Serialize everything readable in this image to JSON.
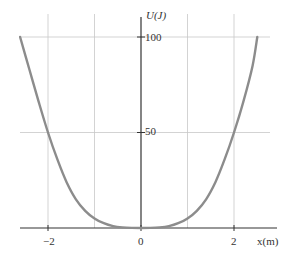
{
  "chart_data": {
    "type": "line",
    "title": "",
    "xlabel": "x(m)",
    "ylabel": "U(J)",
    "xlim": [
      -2.6,
      2.5
    ],
    "ylim": [
      0,
      100
    ],
    "x_ticks": [
      -2,
      0,
      2
    ],
    "x_tick_labels": [
      "-2",
      "0",
      "2"
    ],
    "y_ticks": [
      50,
      100
    ],
    "y_tick_labels": [
      "50",
      "100"
    ],
    "grid": true,
    "grid_x": [
      -2,
      -1,
      1,
      2
    ],
    "grid_y": [
      50,
      100
    ],
    "legend": null,
    "series": [
      {
        "name": "U(x)",
        "color": "#8c8c8c",
        "x": [
          -2.6,
          -2.4,
          -2.2,
          -2.0,
          -1.8,
          -1.6,
          -1.4,
          -1.2,
          -1.0,
          -0.8,
          -0.6,
          -0.4,
          -0.2,
          0.0,
          0.2,
          0.4,
          0.6,
          0.8,
          1.0,
          1.2,
          1.4,
          1.6,
          1.8,
          2.0,
          2.2,
          2.4,
          2.5
        ],
        "values": [
          100,
          83,
          66,
          50,
          36,
          24,
          15,
          9,
          5,
          2.5,
          1,
          0.3,
          0.05,
          0,
          0.05,
          0.3,
          1,
          2.5,
          5,
          9,
          15,
          24,
          36,
          50,
          66,
          85,
          100
        ]
      }
    ]
  },
  "labels": {
    "y_axis": "U(J)",
    "x_axis": "x(m)",
    "y100": "100",
    "y50": "50",
    "xm2": "−2",
    "x0": "0",
    "x2": "2"
  }
}
